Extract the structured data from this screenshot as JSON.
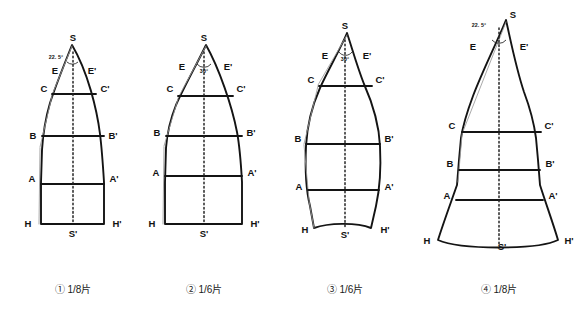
{
  "figure": {
    "background_color": "#ffffff",
    "line_color": "#141414",
    "construction_line_color": "#9a9a9a",
    "axis_style": "dashed centerline"
  },
  "vertex_labels": {
    "apex": "S",
    "base_center": "S'",
    "e_left": "E",
    "e_right": "E'",
    "c_left": "C",
    "c_right": "C'",
    "b_left": "B",
    "b_right": "B'",
    "a_left": "A",
    "a_right": "A'",
    "h_left": "H",
    "h_right": "H'"
  },
  "panels": [
    {
      "id": "panel-1",
      "caption": "① 1/8片",
      "number_marker": "①",
      "fraction": "1/8",
      "apex_angle": "22. 5°",
      "base_shape": "flat",
      "silhouette": "parabolic taper, straight parallel sides near base",
      "rib_labels": [
        "E",
        "C",
        "B",
        "A",
        "H"
      ]
    },
    {
      "id": "panel-2",
      "caption": "② 1/6片",
      "number_marker": "②",
      "fraction": "1/6",
      "apex_angle": "30°",
      "base_shape": "flat",
      "silhouette": "wider parabolic taper, straight parallel sides near base",
      "rib_labels": [
        "E",
        "C",
        "B",
        "A",
        "H"
      ]
    },
    {
      "id": "panel-3",
      "caption": "③ 1/6片",
      "number_marker": "③",
      "fraction": "1/6",
      "apex_angle": "30°",
      "base_shape": "concave-up arc",
      "silhouette": "lens / leaf shape tapering at both ends",
      "rib_labels": [
        "E",
        "C",
        "B",
        "A",
        "H"
      ]
    },
    {
      "id": "panel-4",
      "caption": "④ 1/8片",
      "number_marker": "④",
      "fraction": "1/8",
      "apex_angle": "22. 5°",
      "base_shape": "convex-down arc",
      "silhouette": "pointed top flaring outward to a wide curved hem",
      "rib_labels": [
        "E",
        "C",
        "B",
        "A",
        "H"
      ]
    }
  ]
}
